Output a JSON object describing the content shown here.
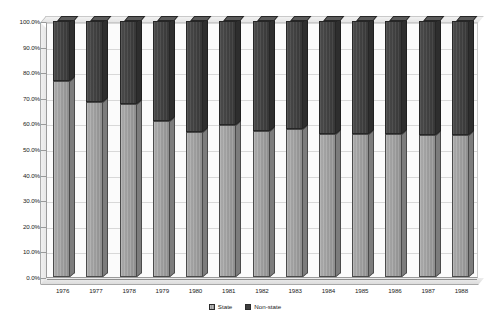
{
  "chart_data": {
    "type": "bar",
    "subtype": "100% stacked column (3-D)",
    "title": "",
    "subtitle": "",
    "xlabel": "",
    "ylabel": "",
    "categories": [
      "1976",
      "1977",
      "1978",
      "1979",
      "1980",
      "1981",
      "1982",
      "1983",
      "1984",
      "1985",
      "1986",
      "1987",
      "1988"
    ],
    "series": [
      {
        "name": "State",
        "color": "#9a9a9a",
        "values": [
          76.5,
          68.5,
          67.5,
          61.0,
          56.5,
          59.5,
          57.0,
          58.0,
          56.0,
          56.0,
          56.0,
          55.5,
          55.5
        ]
      },
      {
        "name": "Non-state",
        "color": "#3f3f3f",
        "values": [
          23.5,
          31.5,
          32.5,
          39.0,
          43.5,
          40.5,
          43.0,
          42.0,
          44.0,
          44.0,
          44.0,
          44.5,
          44.5
        ]
      }
    ],
    "ylim": [
      0,
      100
    ],
    "ytick_values": [
      0,
      10,
      20,
      30,
      40,
      50,
      60,
      70,
      80,
      90,
      100
    ],
    "ytick_labels": [
      "0.0%",
      "10.0%",
      "20.0%",
      "30.0%",
      "40.0%",
      "50.0%",
      "60.0%",
      "70.0%",
      "80.0%",
      "90.0%",
      "100.0%"
    ],
    "grid": true,
    "grid_axis": "y",
    "legend_position": "bottom",
    "legend_entries": [
      "State",
      "Non-state"
    ],
    "annotations": []
  },
  "legend": {
    "items": [
      {
        "label": "State",
        "swatch": "state-swatch-icon"
      },
      {
        "label": "Non-state",
        "swatch": "nonstate-swatch-icon"
      }
    ]
  }
}
